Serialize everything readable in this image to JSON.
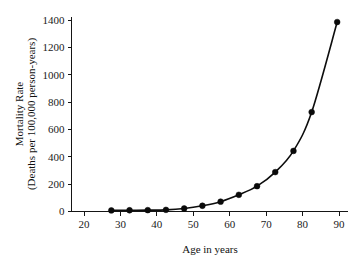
{
  "chart_data": {
    "type": "line",
    "title": "",
    "xlabel": "Age in years",
    "ylabel_line1": "Mortality Rate",
    "ylabel_line2": "(Deaths per 100,000 person-years)",
    "ylabel": "Mortality Rate (Deaths per 100,000 person-years)",
    "xlim": [
      20,
      92
    ],
    "ylim": [
      -40,
      1450
    ],
    "grid": false,
    "legend": false,
    "xticks": [
      20,
      30,
      40,
      50,
      60,
      70,
      80,
      90
    ],
    "xtick_labels": [
      "20",
      "30",
      "40",
      "50",
      "60",
      "70",
      "80",
      "90"
    ],
    "yticks": [
      0,
      200,
      400,
      600,
      800,
      1000,
      1200,
      1400
    ],
    "ytick_labels": [
      "0",
      "200",
      "400",
      "600",
      "800",
      "1000",
      "1200",
      "1400"
    ],
    "marker": "filled-circle",
    "line_color": "#0d0d0d",
    "marker_color": "#0a0a0a",
    "x": [
      27.5,
      32.5,
      37.5,
      42.5,
      47.5,
      52.5,
      57.5,
      62.5,
      67.5,
      72.5,
      77.5,
      82.5,
      89.5
    ],
    "values": [
      8,
      9,
      10,
      12,
      22,
      42,
      72,
      122,
      185,
      288,
      443,
      727,
      1385
    ],
    "series": [
      {
        "name": "Mortality rate by age",
        "values": [
          8,
          9,
          10,
          12,
          22,
          42,
          72,
          122,
          185,
          288,
          443,
          727,
          1385
        ]
      }
    ]
  }
}
